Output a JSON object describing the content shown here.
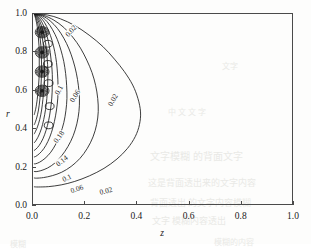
{
  "figure": {
    "background_color": "#fdfdfc",
    "axis_color": "#4a4a4a",
    "contour_color": "#1a1a1a"
  },
  "axes": {
    "x": {
      "title": "z",
      "ticks": [
        "0.0",
        "0.2",
        "0.4",
        "0.6",
        "0.8",
        "1.0"
      ],
      "tick_values": [
        0.0,
        0.2,
        0.4,
        0.6,
        0.8,
        1.0
      ],
      "range": [
        0.0,
        1.0
      ]
    },
    "y": {
      "title": "r",
      "ticks": [
        "0.0",
        "0.2",
        "0.4",
        "0.6",
        "0.8",
        "1.0"
      ],
      "tick_values": [
        0.0,
        0.2,
        0.4,
        0.6,
        0.8,
        1.0
      ],
      "range": [
        0.0,
        1.0
      ]
    }
  },
  "contour_labels": [
    {
      "text": "0.02",
      "x": 0.148,
      "y": 0.905,
      "rotation": -48
    },
    {
      "text": "0.1",
      "x": 0.104,
      "y": 0.597,
      "rotation": -62
    },
    {
      "text": "0.06",
      "x": 0.164,
      "y": 0.568,
      "rotation": -58
    },
    {
      "text": "0.02",
      "x": 0.31,
      "y": 0.545,
      "rotation": -60
    },
    {
      "text": "0.18",
      "x": 0.105,
      "y": 0.352,
      "rotation": -54
    },
    {
      "text": "0.14",
      "x": 0.116,
      "y": 0.23,
      "rotation": -38
    },
    {
      "text": "0.1",
      "x": 0.136,
      "y": 0.139,
      "rotation": -26
    },
    {
      "text": "0.06",
      "x": 0.172,
      "y": 0.085,
      "rotation": -18
    },
    {
      "text": "0.02",
      "x": 0.283,
      "y": 0.072,
      "rotation": -14
    }
  ],
  "ghost_text": [
    {
      "text": "中 文 文 字",
      "x": 168,
      "y": 106,
      "size": 8
    },
    {
      "text": "文字模糊 的背面文字",
      "x": 150,
      "y": 148,
      "size": 10
    },
    {
      "text": "这是背面透出来的文字内容",
      "x": 148,
      "y": 176,
      "size": 9
    },
    {
      "text": "背面透出 的文字内容模糊",
      "x": 150,
      "y": 196,
      "size": 9
    },
    {
      "text": "文字 模糊内容透出",
      "x": 152,
      "y": 214,
      "size": 9
    },
    {
      "text": "模糊",
      "x": 10,
      "y": 238,
      "size": 8
    },
    {
      "text": "模糊的内容",
      "x": 214,
      "y": 236,
      "size": 8
    },
    {
      "text": "文字",
      "x": 222,
      "y": 60,
      "size": 8
    }
  ],
  "chart_data": {
    "type": "contour",
    "title": "",
    "xlabel": "z",
    "ylabel": "r",
    "xlim": [
      0.0,
      1.0
    ],
    "ylim": [
      0.0,
      1.0
    ],
    "grid": false,
    "legend": "none",
    "levels": [
      0.02,
      0.06,
      0.1,
      0.14,
      0.18,
      0.22,
      0.26,
      0.3,
      0.34,
      0.38
    ],
    "labeled_levels": [
      0.02,
      0.06,
      0.1,
      0.14,
      0.18
    ],
    "level_step": 0.04,
    "local_maxima": [
      {
        "z": 0.035,
        "r": 0.905
      },
      {
        "z": 0.035,
        "r": 0.8
      },
      {
        "z": 0.035,
        "r": 0.7
      },
      {
        "z": 0.035,
        "r": 0.6
      }
    ],
    "small_closed_loops": [
      {
        "z": 0.057,
        "r": 0.845
      },
      {
        "z": 0.057,
        "r": 0.74
      },
      {
        "z": 0.06,
        "r": 0.64
      },
      {
        "z": 0.064,
        "r": 0.52
      },
      {
        "z": 0.06,
        "r": 0.42
      }
    ],
    "contours": [
      {
        "level": 0.02,
        "path": [
          [
            0.005,
            1.0
          ],
          [
            0.055,
            0.995
          ],
          [
            0.105,
            0.975
          ],
          [
            0.16,
            0.94
          ],
          [
            0.215,
            0.89
          ],
          [
            0.268,
            0.83
          ],
          [
            0.312,
            0.765
          ],
          [
            0.35,
            0.7
          ],
          [
            0.382,
            0.63
          ],
          [
            0.402,
            0.56
          ],
          [
            0.412,
            0.49
          ],
          [
            0.408,
            0.425
          ],
          [
            0.392,
            0.362
          ],
          [
            0.362,
            0.3
          ],
          [
            0.322,
            0.245
          ],
          [
            0.272,
            0.196
          ],
          [
            0.216,
            0.157
          ],
          [
            0.16,
            0.128
          ],
          [
            0.108,
            0.11
          ],
          [
            0.06,
            0.101
          ],
          [
            0.02,
            0.099
          ],
          [
            0.005,
            0.1
          ]
        ]
      },
      {
        "level": 0.06,
        "path": [
          [
            0.005,
            1.0
          ],
          [
            0.042,
            0.992
          ],
          [
            0.08,
            0.968
          ],
          [
            0.118,
            0.93
          ],
          [
            0.152,
            0.88
          ],
          [
            0.182,
            0.822
          ],
          [
            0.206,
            0.76
          ],
          [
            0.226,
            0.695
          ],
          [
            0.24,
            0.628
          ],
          [
            0.248,
            0.56
          ],
          [
            0.25,
            0.492
          ],
          [
            0.244,
            0.425
          ],
          [
            0.23,
            0.36
          ],
          [
            0.208,
            0.3
          ],
          [
            0.18,
            0.248
          ],
          [
            0.146,
            0.206
          ],
          [
            0.11,
            0.176
          ],
          [
            0.074,
            0.158
          ],
          [
            0.04,
            0.148
          ],
          [
            0.014,
            0.145
          ],
          [
            0.005,
            0.146
          ]
        ]
      },
      {
        "level": 0.1,
        "path": [
          [
            0.005,
            1.0
          ],
          [
            0.036,
            0.99
          ],
          [
            0.066,
            0.964
          ],
          [
            0.094,
            0.924
          ],
          [
            0.118,
            0.874
          ],
          [
            0.138,
            0.818
          ],
          [
            0.154,
            0.756
          ],
          [
            0.166,
            0.692
          ],
          [
            0.174,
            0.626
          ],
          [
            0.178,
            0.558
          ],
          [
            0.176,
            0.492
          ],
          [
            0.168,
            0.428
          ],
          [
            0.154,
            0.366
          ],
          [
            0.134,
            0.31
          ],
          [
            0.11,
            0.262
          ],
          [
            0.084,
            0.224
          ],
          [
            0.056,
            0.198
          ],
          [
            0.03,
            0.184
          ],
          [
            0.012,
            0.179
          ],
          [
            0.005,
            0.18
          ]
        ]
      },
      {
        "level": 0.14,
        "path": [
          [
            0.005,
            1.0
          ],
          [
            0.03,
            0.988
          ],
          [
            0.054,
            0.96
          ],
          [
            0.075,
            0.918
          ],
          [
            0.093,
            0.868
          ],
          [
            0.107,
            0.812
          ],
          [
            0.118,
            0.752
          ],
          [
            0.125,
            0.69
          ],
          [
            0.129,
            0.626
          ],
          [
            0.13,
            0.56
          ],
          [
            0.126,
            0.496
          ],
          [
            0.118,
            0.434
          ],
          [
            0.105,
            0.376
          ],
          [
            0.088,
            0.324
          ],
          [
            0.068,
            0.28
          ],
          [
            0.046,
            0.248
          ],
          [
            0.025,
            0.228
          ],
          [
            0.01,
            0.22
          ],
          [
            0.005,
            0.22
          ]
        ]
      },
      {
        "level": 0.18,
        "path": [
          [
            0.005,
            1.0
          ],
          [
            0.025,
            0.986
          ],
          [
            0.044,
            0.956
          ],
          [
            0.06,
            0.912
          ],
          [
            0.073,
            0.862
          ],
          [
            0.083,
            0.806
          ],
          [
            0.09,
            0.748
          ],
          [
            0.094,
            0.688
          ],
          [
            0.096,
            0.626
          ],
          [
            0.095,
            0.562
          ],
          [
            0.09,
            0.5
          ],
          [
            0.082,
            0.44
          ],
          [
            0.071,
            0.384
          ],
          [
            0.057,
            0.336
          ],
          [
            0.041,
            0.298
          ],
          [
            0.024,
            0.272
          ],
          [
            0.01,
            0.258
          ],
          [
            0.005,
            0.256
          ]
        ]
      },
      {
        "level": 0.22,
        "path": [
          [
            0.005,
            1.0
          ],
          [
            0.021,
            0.984
          ],
          [
            0.036,
            0.952
          ],
          [
            0.049,
            0.906
          ],
          [
            0.059,
            0.856
          ],
          [
            0.066,
            0.8
          ],
          [
            0.071,
            0.742
          ],
          [
            0.074,
            0.684
          ],
          [
            0.074,
            0.624
          ],
          [
            0.072,
            0.562
          ],
          [
            0.067,
            0.502
          ],
          [
            0.06,
            0.446
          ],
          [
            0.05,
            0.394
          ],
          [
            0.038,
            0.35
          ],
          [
            0.024,
            0.316
          ],
          [
            0.011,
            0.296
          ],
          [
            0.005,
            0.29
          ]
        ]
      },
      {
        "level": 0.26,
        "path": [
          [
            0.005,
            1.0
          ],
          [
            0.018,
            0.982
          ],
          [
            0.03,
            0.948
          ],
          [
            0.04,
            0.902
          ],
          [
            0.048,
            0.85
          ],
          [
            0.053,
            0.794
          ],
          [
            0.056,
            0.736
          ],
          [
            0.057,
            0.678
          ],
          [
            0.056,
            0.62
          ],
          [
            0.053,
            0.56
          ],
          [
            0.048,
            0.502
          ],
          [
            0.041,
            0.45
          ],
          [
            0.032,
            0.402
          ],
          [
            0.021,
            0.364
          ],
          [
            0.01,
            0.338
          ],
          [
            0.005,
            0.33
          ]
        ]
      },
      {
        "level": 0.3,
        "path": [
          [
            0.005,
            1.0
          ],
          [
            0.015,
            0.98
          ],
          [
            0.025,
            0.944
          ],
          [
            0.033,
            0.896
          ],
          [
            0.039,
            0.844
          ],
          [
            0.042,
            0.788
          ],
          [
            0.044,
            0.73
          ],
          [
            0.044,
            0.672
          ],
          [
            0.042,
            0.614
          ],
          [
            0.038,
            0.556
          ],
          [
            0.033,
            0.5
          ],
          [
            0.026,
            0.452
          ],
          [
            0.017,
            0.412
          ],
          [
            0.008,
            0.384
          ],
          [
            0.005,
            0.376
          ]
        ]
      },
      {
        "level": 0.34,
        "path": [
          [
            0.005,
            1.0
          ],
          [
            0.012,
            0.978
          ],
          [
            0.02,
            0.94
          ],
          [
            0.026,
            0.89
          ],
          [
            0.03,
            0.838
          ],
          [
            0.032,
            0.782
          ],
          [
            0.033,
            0.724
          ],
          [
            0.032,
            0.666
          ],
          [
            0.03,
            0.608
          ],
          [
            0.026,
            0.552
          ],
          [
            0.021,
            0.5
          ],
          [
            0.014,
            0.458
          ],
          [
            0.007,
            0.43
          ],
          [
            0.005,
            0.424
          ]
        ]
      },
      {
        "level": 0.38,
        "path": [
          [
            0.005,
            1.0
          ],
          [
            0.01,
            0.976
          ],
          [
            0.016,
            0.936
          ],
          [
            0.02,
            0.886
          ],
          [
            0.023,
            0.834
          ],
          [
            0.024,
            0.778
          ],
          [
            0.024,
            0.72
          ],
          [
            0.023,
            0.662
          ],
          [
            0.02,
            0.606
          ],
          [
            0.016,
            0.554
          ],
          [
            0.011,
            0.51
          ],
          [
            0.006,
            0.482
          ],
          [
            0.005,
            0.476
          ]
        ]
      }
    ]
  }
}
